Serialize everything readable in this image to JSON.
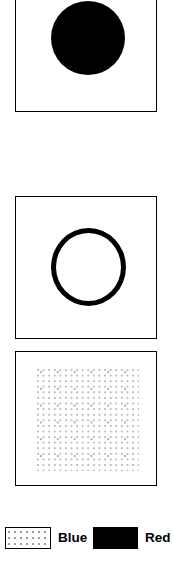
{
  "figure": {
    "type": "diagram",
    "background_color": "#ffffff",
    "stroke_color": "#000000",
    "panels": [
      {
        "id": "panel-filled",
        "name": "top-panel",
        "shape": "filled-disc",
        "shape_fill": "solid-black",
        "shape_legend_category": "Red",
        "clipped_at_top": true
      },
      {
        "id": "panel-outline",
        "name": "middle-panel",
        "shape": "ring-outline",
        "shape_fill": "none",
        "shape_stroke": "solid-black",
        "shape_legend_category": "Red",
        "clipped_at_top": false
      },
      {
        "id": "panel-dotted",
        "name": "bottom-panel",
        "shape": "dot-matrix-fill",
        "shape_fill": "stippled-dots",
        "shape_legend_category": "Blue",
        "clipped_at_top": false
      }
    ]
  },
  "legend": {
    "items": [
      {
        "swatch_style": "dotted",
        "swatch_fill_color": "#ffffff",
        "swatch_border_color": "#000000",
        "label": "Blue"
      },
      {
        "swatch_style": "solid",
        "swatch_fill_color": "#000000",
        "swatch_border_color": "#000000",
        "label": "Red"
      }
    ]
  },
  "bottom_strip": {
    "text": ""
  },
  "chart_data": {
    "type": "diagram",
    "title": "",
    "panels": [
      {
        "label": "",
        "region": "filled circle",
        "category": "Red"
      },
      {
        "label": "",
        "region": "circle outline",
        "category": "Red"
      },
      {
        "label": "",
        "region": "dotted square region",
        "category": "Blue"
      }
    ],
    "legend": [
      "Blue",
      "Red"
    ],
    "legend_position": "bottom"
  }
}
